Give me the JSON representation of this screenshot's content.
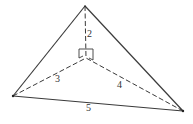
{
  "diagram": {
    "type": "triangle-with-interior-point",
    "vertices": {
      "top": [
        85,
        6
      ],
      "left": [
        13,
        96
      ],
      "right": [
        183,
        111
      ],
      "center": [
        86,
        58
      ]
    },
    "segment_labels": {
      "top_to_center": "2",
      "left_to_center": "3",
      "right_to_center": "4",
      "left_to_right": "5"
    },
    "label_positions": {
      "top_to_center": [
        87,
        29
      ],
      "left_to_center": [
        55,
        74
      ],
      "right_to_center": [
        117,
        80
      ],
      "left_to_right": [
        86,
        103
      ]
    },
    "colors": {
      "line": "#3a3a3a",
      "text": "#333333",
      "background": "#ffffff"
    }
  }
}
